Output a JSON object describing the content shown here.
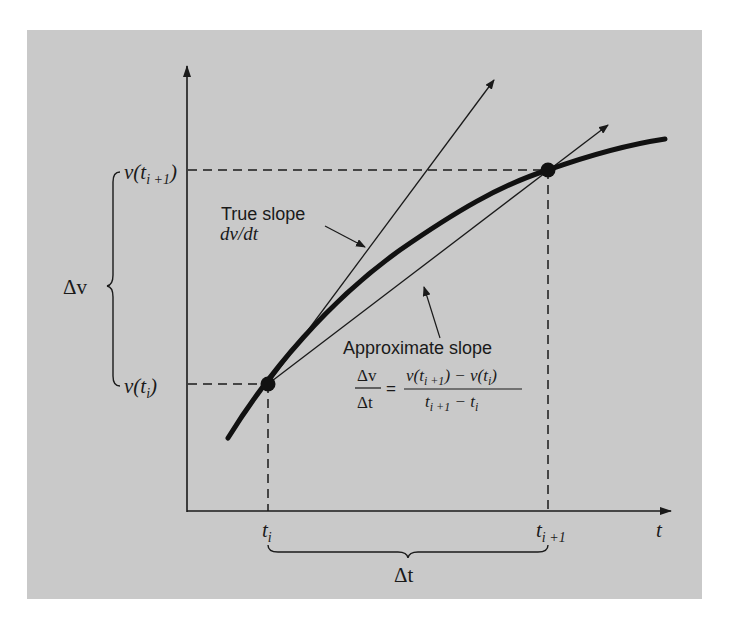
{
  "figure": {
    "background": "#c9c9c9",
    "ink": "#1a1a1a",
    "axes": {
      "x_label": "t",
      "y_label": ""
    },
    "points": [
      {
        "name": "t_i",
        "x_label": "t",
        "x_sub": "i",
        "y_label_pre": "v(t",
        "y_sub": "i",
        "y_label_post": ")"
      },
      {
        "name": "t_i+1",
        "x_label": "t",
        "x_sub": "i +1",
        "y_label_pre": "v(t",
        "y_sub": "i +1",
        "y_label_post": ")"
      }
    ],
    "delta_v_label": "Δv",
    "delta_t_label": "Δt",
    "true_slope": {
      "title": "True slope",
      "expr": "dv/dt"
    },
    "approx_slope": {
      "title": "Approximate slope",
      "lhs_num": "Δv",
      "lhs_den": "Δt",
      "equals": "=",
      "rhs_num_a": "v(t",
      "rhs_num_a_sub": "i +1",
      "rhs_num_b": ") − v(t",
      "rhs_num_b_sub": "i",
      "rhs_num_c": ")",
      "rhs_den_a": "t",
      "rhs_den_a_sub": "i +1",
      "rhs_den_b": " − t",
      "rhs_den_b_sub": "i"
    }
  }
}
